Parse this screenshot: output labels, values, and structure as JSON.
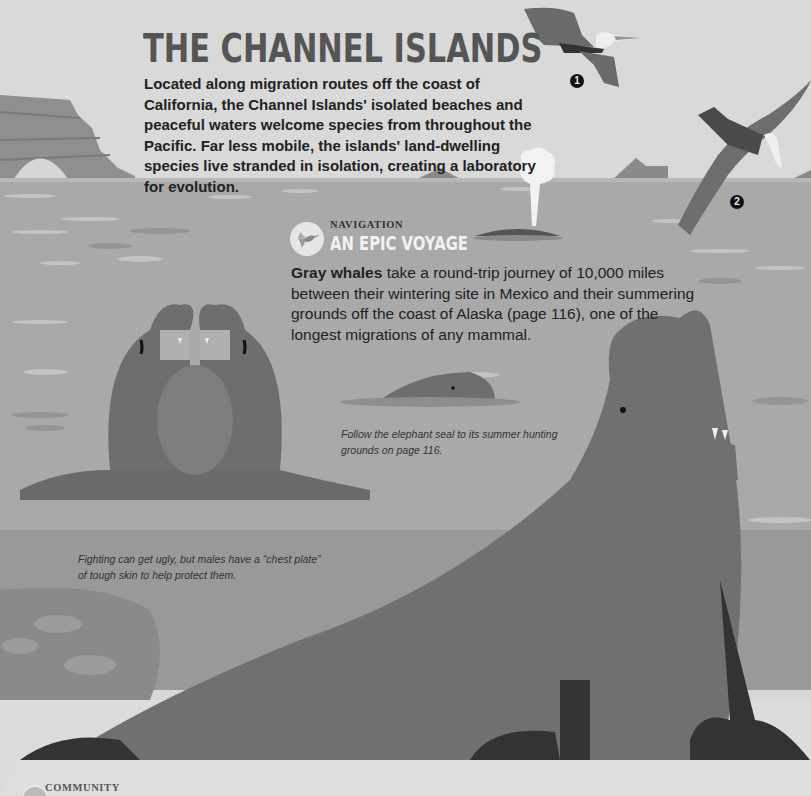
{
  "page": {
    "title": "THE CHANNEL ISLANDS",
    "intro": "Located along migration routes off the coast of California, the Channel Islands' isolated beaches and peaceful waters welcome species from throughout the Pacific. Far less mobile, the islands' land-dwelling species live stranded in isolation, creating a laboratory for evolution."
  },
  "callouts": {
    "bird_1": "1",
    "bird_2": "2"
  },
  "navigation_section": {
    "kicker": "NAVIGATION",
    "icon": "hummingbird-icon",
    "title": "AN EPIC VOYAGE",
    "body_bold": "Gray whales",
    "body_rest": " take a round-trip journey of 10,000 miles between their wintering site in Mexico and their summering grounds off the coast of Alaska (page 116), one of the longest migrations of any mammal."
  },
  "captions": {
    "elephant_seal": "Follow the elephant seal to its summer hunting grounds on page 116.",
    "fighting": "Fighting can get ugly, but males have a “chest plate” of tough skin to help protect them."
  },
  "community_section": {
    "kicker": "COMMUNITY",
    "icon": "community-badge-icon"
  },
  "colors": {
    "sky": "#d9d9d9",
    "sea": "#a9a9a9",
    "seal_body": "#7a7a7a",
    "title": "#555555",
    "text": "#222222",
    "beach": "#dcdcdc"
  }
}
